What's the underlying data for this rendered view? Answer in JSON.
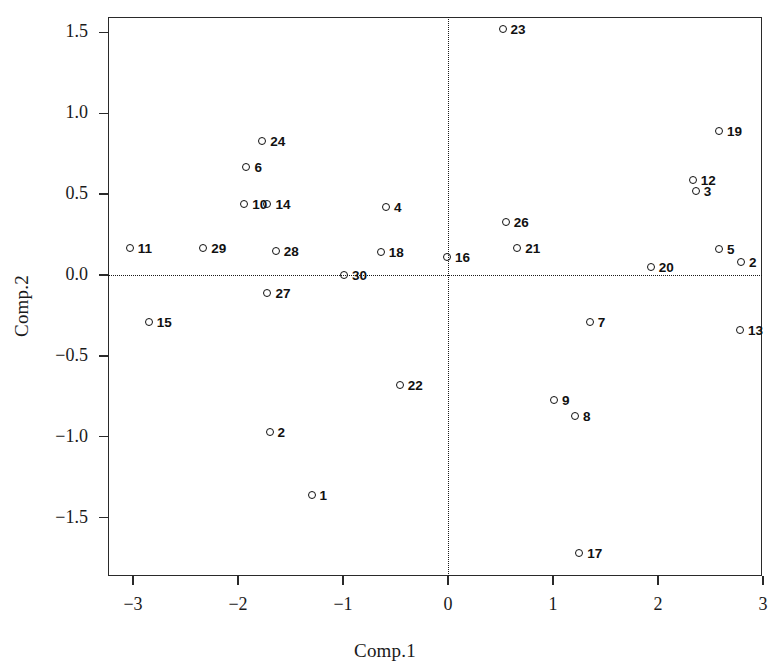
{
  "chart_data": {
    "type": "scatter",
    "title": "",
    "xlabel": "Comp.1",
    "ylabel": "Comp.2",
    "xlim": [
      -3.24,
      3.0
    ],
    "ylim": [
      -1.85,
      1.71
    ],
    "xticks": [
      -3,
      -2,
      -1,
      0,
      1,
      2,
      3
    ],
    "xtick_labels": [
      "−3",
      "−2",
      "−1",
      "0",
      "1",
      "2",
      "3"
    ],
    "yticks": [
      -1.5,
      -1.0,
      -0.5,
      0.0,
      0.5,
      1.0,
      1.5
    ],
    "ytick_labels": [
      "−1.5",
      "−1.0",
      "−0.5",
      "0.0",
      "0.5",
      "1.0",
      "1.5"
    ],
    "grid": false,
    "reference_lines": [
      {
        "axis": "h",
        "value": 0.0,
        "style": "dotted"
      },
      {
        "axis": "v",
        "value": 0.0,
        "style": "dotted"
      }
    ],
    "legend": null,
    "marker": "open-circle",
    "label_position": "right",
    "points": [
      {
        "label": "1",
        "x": -1.3,
        "y": -1.36
      },
      {
        "label": "2",
        "x": -1.7,
        "y": -0.97
      },
      {
        "label": "3",
        "x": 2.36,
        "y": 0.52
      },
      {
        "label": "4",
        "x": -0.59,
        "y": 0.42
      },
      {
        "label": "5",
        "x": 2.58,
        "y": 0.16
      },
      {
        "label": "6",
        "x": -1.92,
        "y": 0.67
      },
      {
        "label": "7",
        "x": 1.35,
        "y": -0.29
      },
      {
        "label": "8",
        "x": 1.21,
        "y": -0.87
      },
      {
        "label": "9",
        "x": 1.01,
        "y": -0.77
      },
      {
        "label": "10",
        "x": -1.94,
        "y": 0.44
      },
      {
        "label": "11",
        "x": -3.03,
        "y": 0.17
      },
      {
        "label": "12",
        "x": 2.33,
        "y": 0.59
      },
      {
        "label": "13",
        "x": 2.78,
        "y": -0.34
      },
      {
        "label": "14",
        "x": -1.72,
        "y": 0.44
      },
      {
        "label": "15",
        "x": -2.85,
        "y": -0.29
      },
      {
        "label": "16",
        "x": -0.01,
        "y": 0.11
      },
      {
        "label": "17",
        "x": 1.25,
        "y": -1.72
      },
      {
        "label": "18",
        "x": -0.64,
        "y": 0.14
      },
      {
        "label": "19",
        "x": 2.58,
        "y": 0.89
      },
      {
        "label": "20",
        "x": 1.93,
        "y": 0.05
      },
      {
        "label": "21",
        "x": 0.66,
        "y": 0.17
      },
      {
        "label": "22",
        "x": -0.46,
        "y": -0.68
      },
      {
        "label": "23",
        "x": 0.52,
        "y": 1.52
      },
      {
        "label": "24",
        "x": -1.77,
        "y": 0.83
      },
      {
        "label": "26",
        "x": 0.55,
        "y": 0.33
      },
      {
        "label": "27",
        "x": -1.72,
        "y": -0.11
      },
      {
        "label": "28",
        "x": -1.64,
        "y": 0.15
      },
      {
        "label": "29",
        "x": -2.33,
        "y": 0.17
      },
      {
        "label": "30",
        "x": -0.99,
        "y": 0.0
      },
      {
        "label": "2 ",
        "x": 2.79,
        "y": 0.08
      }
    ]
  },
  "axes": {
    "x_title": "Comp.1",
    "y_title": "Comp.2"
  }
}
